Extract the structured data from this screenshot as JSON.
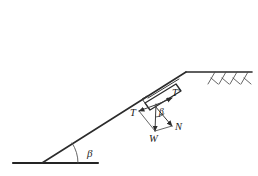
{
  "figure": {
    "background_color": "#ffffff",
    "line_color": "#2b2b2b"
  },
  "labels": {
    "beta_slope": "β",
    "beta_forces": "β",
    "tension_down": "T",
    "tension_up": "T′",
    "normal": "N",
    "weight": "W"
  },
  "geometry": {
    "ground_line": {
      "x1": 13,
      "y1": 163,
      "x2": 98,
      "y2": 163
    },
    "slope_line": {
      "x1": 42,
      "y1": 163,
      "x2": 186,
      "y2": 72
    },
    "crest_line": {
      "x1": 186,
      "y1": 72,
      "x2": 252,
      "y2": 72
    },
    "slope_angle_degrees": 32,
    "block": {
      "cx": 158,
      "cy": 100
    },
    "hatch_count": 4
  },
  "vectors": {
    "T": {
      "from": [
        158,
        103
      ],
      "to": [
        137,
        111
      ]
    },
    "T_prime": {
      "from": [
        158,
        103
      ],
      "to": [
        180,
        93
      ]
    },
    "N": {
      "from": [
        158,
        103
      ],
      "to": [
        175,
        127
      ]
    },
    "W": {
      "from": [
        158,
        103
      ],
      "to": [
        157,
        133
      ]
    }
  }
}
